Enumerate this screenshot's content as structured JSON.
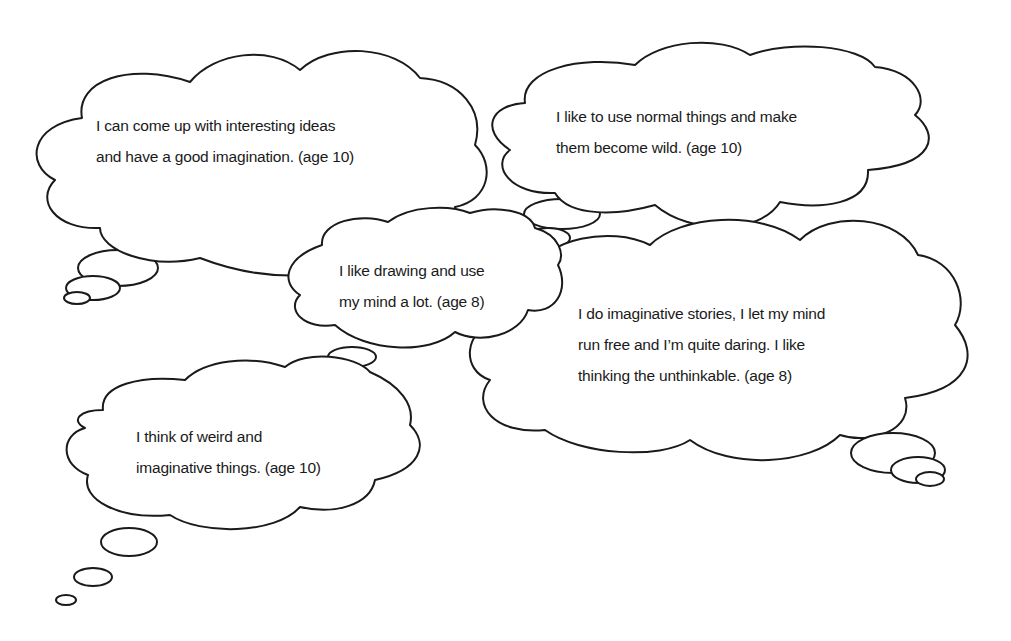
{
  "bubbles": [
    {
      "id": "bubble-1",
      "lines": [
        "I can come up with interesting ideas",
        "and have a good imagination. (age 10)"
      ],
      "age": 10
    },
    {
      "id": "bubble-2",
      "lines": [
        "I like to use normal things and make",
        "them become wild. (age 10)"
      ],
      "age": 10
    },
    {
      "id": "bubble-3",
      "lines": [
        "I like drawing and use",
        "my mind a lot. (age 8)"
      ],
      "age": 8
    },
    {
      "id": "bubble-4",
      "lines": [
        "I do imaginative stories, I let my mind",
        "run free and I’m quite daring. I like",
        "thinking the unthinkable. (age 8)"
      ],
      "age": 8
    },
    {
      "id": "bubble-5",
      "lines": [
        "I think of weird and",
        "imaginative things. (age 10)"
      ],
      "age": 10
    }
  ],
  "colors": {
    "stroke": "#1a1a1a",
    "fill": "#ffffff",
    "text": "#1a1a1a"
  }
}
